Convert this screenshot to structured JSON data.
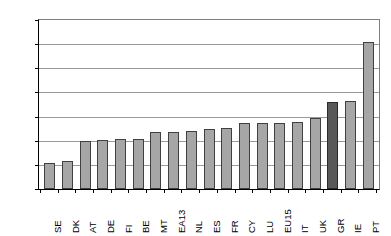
{
  "chart_data": {
    "type": "bar",
    "title": "",
    "xlabel": "",
    "ylabel": "",
    "ylim": [
      0,
      0.35
    ],
    "ytick_step": 0.05,
    "grid": true,
    "legend": false,
    "yticks": [
      "0",
      "0.05",
      "0.1",
      "0.15",
      "0.2",
      "0.25",
      "0.3",
      "0.35"
    ],
    "ytick_values": [
      0,
      0.05,
      0.1,
      0.15,
      0.2,
      0.25,
      0.3,
      0.35
    ],
    "categories": [
      "SE",
      "DK",
      "AT",
      "DE",
      "FI",
      "BE",
      "MT",
      "EA13",
      "NL",
      "ES",
      "FR",
      "CY",
      "LU",
      "EU15",
      "IT",
      "UK",
      "GR",
      "IE",
      "PT"
    ],
    "values": [
      0.054,
      0.059,
      0.1,
      0.102,
      0.104,
      0.104,
      0.118,
      0.119,
      0.121,
      0.124,
      0.127,
      0.136,
      0.137,
      0.137,
      0.138,
      0.147,
      0.18,
      0.182,
      0.305
    ],
    "highlight_category": "GR",
    "colors": {
      "bar_fill": "#a6a6a6",
      "bar_border": "#404040",
      "highlight_fill": "#595959",
      "highlight_border": "#2b2b2b",
      "gridline": "#9a9a9a",
      "axis": "#000000",
      "background": "#ffffff"
    }
  }
}
